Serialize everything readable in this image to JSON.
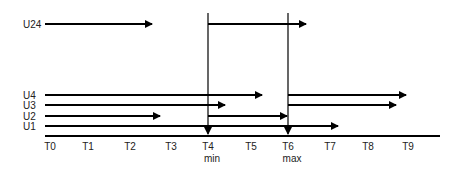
{
  "diagram": {
    "type": "timeline",
    "colors": {
      "line": "#000000",
      "text": "#222222",
      "background": "#ffffff"
    },
    "rows": [
      {
        "label": "U24",
        "y": 24
      },
      {
        "label": "U4",
        "y": 95
      },
      {
        "label": "U3",
        "y": 105
      },
      {
        "label": "U2",
        "y": 116
      },
      {
        "label": "U1",
        "y": 126
      }
    ],
    "ticks": [
      {
        "label": "T0",
        "x": 50,
        "sub": ""
      },
      {
        "label": "T1",
        "x": 88,
        "sub": ""
      },
      {
        "label": "T2",
        "x": 130,
        "sub": ""
      },
      {
        "label": "T3",
        "x": 171,
        "sub": ""
      },
      {
        "label": "T4",
        "x": 208,
        "sub": "min"
      },
      {
        "label": "T5",
        "x": 251,
        "sub": ""
      },
      {
        "label": "T6",
        "x": 288,
        "sub": "max"
      },
      {
        "label": "T7",
        "x": 330,
        "sub": ""
      },
      {
        "label": "T8",
        "x": 368,
        "sub": ""
      },
      {
        "label": "T9",
        "x": 408,
        "sub": ""
      }
    ],
    "axis": {
      "x1": 45,
      "x2": 440,
      "y": 136
    },
    "markers": [
      {
        "name": "min",
        "x": 208,
        "y_top": 13,
        "y_bottom": 134
      },
      {
        "name": "max",
        "x": 288,
        "y_top": 13,
        "y_bottom": 134
      }
    ],
    "arrows": [
      {
        "row": "U24",
        "x1": 45,
        "x2": 152,
        "y": 24,
        "head": true
      },
      {
        "row": "U24",
        "x1": 208,
        "x2": 306,
        "y": 24,
        "head": true
      },
      {
        "row": "U4",
        "x1": 45,
        "x2": 262,
        "y": 95,
        "head": true
      },
      {
        "row": "U4",
        "x1": 288,
        "x2": 406,
        "y": 95,
        "head": true
      },
      {
        "row": "U3",
        "x1": 45,
        "x2": 225,
        "y": 105,
        "head": true
      },
      {
        "row": "U3",
        "x1": 288,
        "x2": 396,
        "y": 105,
        "head": true
      },
      {
        "row": "U2",
        "x1": 45,
        "x2": 160,
        "y": 116,
        "head": true
      },
      {
        "row": "U2",
        "x1": 208,
        "x2": 287,
        "y": 116,
        "head": true
      },
      {
        "row": "U1",
        "x1": 45,
        "x2": 338,
        "y": 126,
        "head": true
      }
    ]
  }
}
